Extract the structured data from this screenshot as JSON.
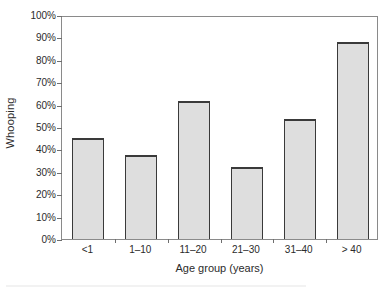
{
  "chart_data": {
    "type": "bar",
    "title": "",
    "subtitle": "",
    "xlabel": "Age group (years)",
    "ylabel": "Whooping",
    "categories": [
      "<1",
      "1–10",
      "11–20",
      "21–30",
      "31–40",
      "> 40"
    ],
    "values": [
      45,
      37.5,
      61.5,
      32,
      53.5,
      88
    ],
    "value_unit": "%",
    "ylim": [
      0,
      100
    ],
    "y_ticks": [
      0,
      10,
      20,
      30,
      40,
      50,
      60,
      70,
      80,
      90,
      100
    ],
    "y_tick_labels": [
      "0%",
      "10%",
      "20%",
      "30%",
      "40%",
      "50%",
      "60%",
      "70%",
      "80%",
      "90%",
      "100%"
    ],
    "grid": false,
    "legend": null,
    "legend_position": "none",
    "series": [
      {
        "name": "Whooping",
        "values": [
          45,
          37.5,
          61.5,
          32,
          53.5,
          88
        ]
      }
    ],
    "annotations": []
  },
  "style": {
    "bar_fill": "#dedede",
    "bar_edge": "#3a3a3a",
    "frame_color": "#8a8a8a",
    "tick_color": "#6e6e6e",
    "text_color": "#2b2b2b",
    "background": "#ffffff"
  }
}
